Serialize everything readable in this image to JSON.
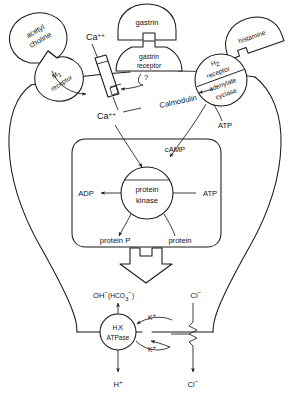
{
  "diagram": {
    "type": "biological-signalling-pathway"
  },
  "ligands": {
    "acetylcholine": "acetyl\ncholine",
    "acetylcholine_line1": "acetyl",
    "acetylcholine_line2": "choline",
    "gastrin": "gastrin",
    "histamine": "histamine"
  },
  "receptors": {
    "m1_symbol": "M",
    "m1_subscript": "1",
    "m1_second_line": "receptor",
    "gastrin_line1": "gastrin",
    "gastrin_line2": "receptor",
    "h2_symbol": "H",
    "h2_subscript": "2",
    "h2_second_line": "receptor",
    "adenylate_line1": "adenylate",
    "adenylate_line2": "cyclase",
    "unknown_mediator": "?"
  },
  "messengers": {
    "calcium_extracellular_base": "Ca",
    "calcium_extracellular_sup": "++",
    "calcium_intracellular_base": "Ca",
    "calcium_intracellular_sup": "++",
    "calmodulin": "Calmodulin",
    "atp_cyclase": "ATP",
    "camp": "cAMP"
  },
  "kinase_box": {
    "enzyme_line1": "protein",
    "enzyme_line2": "kinase",
    "substrate_atp": "ATP",
    "product_adp": "ADP",
    "substrate_protein": "protein",
    "product_protein_p": "protein P"
  },
  "secretion": {
    "hydroxide_base": "OH",
    "hydroxide_sup": "−",
    "bicarbonate_open": "(HCO",
    "bicarbonate_sub": "3",
    "bicarbonate_sup": "−",
    "bicarbonate_close": ")",
    "chloride_apical_base": "Cl",
    "chloride_apical_sup": "−",
    "chloride_basal_base": "Cl",
    "chloride_basal_sup": "−",
    "proton_base": "H",
    "proton_sup": "+",
    "pump_line1": "H,K",
    "pump_line2": "ATPase",
    "potassium_out_base": "K",
    "potassium_out_sup": "+",
    "potassium_in_base": "K",
    "potassium_in_sup": "+"
  },
  "colors": {
    "ink": "#1a1a1a",
    "paper": "#ffffff"
  }
}
